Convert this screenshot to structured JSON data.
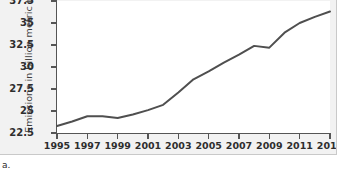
{
  "figure": {
    "item_label": "a."
  },
  "chart_data": {
    "type": "line",
    "title": "",
    "subtitle": "",
    "xlabel": "",
    "ylabel": "Emissions in billion metric tons",
    "xlim": [
      1995,
      2013
    ],
    "ylim": [
      22.5,
      37.5
    ],
    "grid": false,
    "legend": null,
    "line_color": "#4f4f4f",
    "plot_background": "#ffffff",
    "panel_background": "#f2f2f2",
    "axis_color": "#555555",
    "ytick_labels": [
      "37.5",
      "35",
      "32.5",
      "30",
      "27.5",
      "25",
      "22.5"
    ],
    "ytick_values": [
      37.5,
      35,
      32.5,
      30,
      27.5,
      25,
      22.5
    ],
    "xtick_labels": [
      "1995",
      "1997",
      "1999",
      "2001",
      "2003",
      "2005",
      "2007",
      "2009",
      "2011",
      "2013"
    ],
    "xtick_values": [
      1995,
      1997,
      1999,
      2001,
      2003,
      2005,
      2007,
      2009,
      2011,
      2013
    ],
    "x": [
      1995,
      1996,
      1997,
      1998,
      1999,
      2000,
      2001,
      2002,
      2003,
      2004,
      2005,
      2006,
      2007,
      2008,
      2009,
      2010,
      2011,
      2012,
      2013
    ],
    "values": [
      23.3,
      23.8,
      24.4,
      24.4,
      24.2,
      24.6,
      25.1,
      25.7,
      27.1,
      28.6,
      29.5,
      30.5,
      31.4,
      32.4,
      32.2,
      33.9,
      35.0,
      35.7,
      36.3
    ],
    "series": [
      {
        "name": "Emissions",
        "values": [
          23.3,
          23.8,
          24.4,
          24.4,
          24.2,
          24.6,
          25.1,
          25.7,
          27.1,
          28.6,
          29.5,
          30.5,
          31.4,
          32.4,
          32.2,
          33.9,
          35.0,
          35.7,
          36.3
        ]
      }
    ]
  }
}
